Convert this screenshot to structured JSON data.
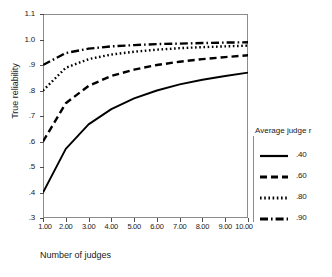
{
  "chart_data": {
    "type": "line",
    "title": "",
    "xlabel": "Number of judges",
    "ylabel": "True reliability",
    "xlim": [
      1,
      10
    ],
    "ylim": [
      0.3,
      1.1
    ],
    "grid": false,
    "legend_position": "right",
    "legend_title": "Average judge r",
    "x": [
      1,
      2,
      3,
      4,
      5,
      6,
      7,
      8,
      9,
      10
    ],
    "x_tick_labels": [
      "1.00",
      "2.00",
      "3.00",
      "4.00",
      "5.00",
      "6.00",
      "7.00",
      "8.00",
      "9.00",
      "10.00"
    ],
    "y_tick_labels": [
      ".3",
      ".4",
      ".5",
      ".6",
      ".7",
      ".8",
      ".9",
      "1.0",
      "1.1"
    ],
    "y_ticks": [
      0.3,
      0.4,
      0.5,
      0.6,
      0.7,
      0.8,
      0.9,
      1.0,
      1.1
    ],
    "series": [
      {
        "name": ".40",
        "style": "solid",
        "values": [
          0.4,
          0.571,
          0.667,
          0.727,
          0.769,
          0.8,
          0.824,
          0.842,
          0.857,
          0.87
        ]
      },
      {
        "name": ".60",
        "style": "dashed",
        "values": [
          0.6,
          0.75,
          0.818,
          0.857,
          0.882,
          0.9,
          0.913,
          0.923,
          0.931,
          0.938
        ]
      },
      {
        "name": ".80",
        "style": "dotted",
        "values": [
          0.8,
          0.889,
          0.923,
          0.941,
          0.952,
          0.96,
          0.966,
          0.97,
          0.973,
          0.976
        ]
      },
      {
        "name": ".90",
        "style": "dashdot",
        "values": [
          0.9,
          0.947,
          0.964,
          0.973,
          0.978,
          0.982,
          0.984,
          0.986,
          0.988,
          0.989
        ]
      }
    ]
  },
  "axes": {
    "y_title": "True reliability",
    "x_title": "Number of judges",
    "y_labels": [
      {
        "text": "1.1",
        "value": 1.1
      },
      {
        "text": "1.0",
        "value": 1.0
      },
      {
        "text": ".9",
        "value": 0.9
      },
      {
        "text": ".8",
        "value": 0.8
      },
      {
        "text": ".7",
        "value": 0.7
      },
      {
        "text": ".6",
        "value": 0.6
      },
      {
        "text": ".5",
        "value": 0.5
      },
      {
        "text": ".4",
        "value": 0.4
      },
      {
        "text": ".3",
        "value": 0.3
      }
    ],
    "x_labels": [
      {
        "text": "1.00",
        "value": 1
      },
      {
        "text": "2.00",
        "value": 2
      },
      {
        "text": "3.00",
        "value": 3
      },
      {
        "text": "4.00",
        "value": 4
      },
      {
        "text": "5.00",
        "value": 5
      },
      {
        "text": "6.00",
        "value": 6
      },
      {
        "text": "7.00",
        "value": 7
      },
      {
        "text": "8.00",
        "value": 8
      },
      {
        "text": "9.00",
        "value": 9
      },
      {
        "text": "10.00",
        "value": 10
      }
    ]
  },
  "legend": {
    "title": "Average judge r",
    "entries": [
      {
        "label": ".40",
        "style": "solid"
      },
      {
        "label": ".60",
        "style": "dashed"
      },
      {
        "label": ".80",
        "style": "dotted"
      },
      {
        "label": ".90",
        "style": "dashdot"
      }
    ]
  },
  "colors": {
    "line": "#000000",
    "frame": "#8c8c8c",
    "tick": "#4d4d4d",
    "background": "#ffffff",
    "text": "#1a1a1a"
  }
}
